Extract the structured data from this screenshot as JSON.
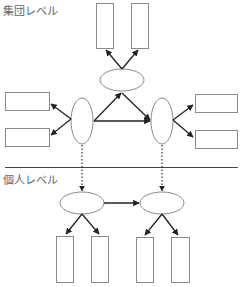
{
  "labels": {
    "group_level": "集団レベル",
    "individual_level": "個人レベル"
  },
  "colors": {
    "shape_stroke": "#8a8a8a",
    "arrow": "#222222",
    "divider": "#444444",
    "label_text": "#666666"
  },
  "diagram": {
    "sections": [
      {
        "name": "group-level",
        "nodes": [
          {
            "id": "top-ellipse",
            "shape": "ellipse",
            "cx": 122,
            "cy": 80,
            "rx": 22,
            "ry": 11
          },
          {
            "id": "left-ellipse",
            "shape": "ellipse",
            "cx": 82,
            "cy": 121,
            "rx": 11,
            "ry": 23
          },
          {
            "id": "right-ellipse",
            "shape": "ellipse",
            "cx": 162,
            "cy": 121,
            "rx": 11,
            "ry": 23
          },
          {
            "id": "top-rect-1",
            "shape": "rect"
          },
          {
            "id": "top-rect-2",
            "shape": "rect"
          },
          {
            "id": "left-rect-1",
            "shape": "rect"
          },
          {
            "id": "left-rect-2",
            "shape": "rect"
          },
          {
            "id": "right-rect-1",
            "shape": "rect"
          },
          {
            "id": "right-rect-2",
            "shape": "rect"
          }
        ],
        "edges": [
          {
            "from": "top-ellipse",
            "to": "top-rect-1",
            "style": "solid"
          },
          {
            "from": "top-ellipse",
            "to": "top-rect-2",
            "style": "solid"
          },
          {
            "from": "left-ellipse",
            "to": "top-ellipse",
            "style": "solid"
          },
          {
            "from": "top-ellipse",
            "to": "right-ellipse",
            "style": "solid"
          },
          {
            "from": "left-ellipse",
            "to": "right-ellipse",
            "style": "solid"
          },
          {
            "from": "left-ellipse",
            "to": "left-rect-1",
            "style": "solid"
          },
          {
            "from": "left-ellipse",
            "to": "left-rect-2",
            "style": "solid"
          },
          {
            "from": "right-ellipse",
            "to": "right-rect-1",
            "style": "solid"
          },
          {
            "from": "right-ellipse",
            "to": "right-rect-2",
            "style": "solid"
          }
        ]
      },
      {
        "name": "individual-level",
        "nodes": [
          {
            "id": "bottom-left-ellipse",
            "shape": "ellipse"
          },
          {
            "id": "bottom-right-ellipse",
            "shape": "ellipse"
          },
          {
            "id": "bottom-rect-1",
            "shape": "rect"
          },
          {
            "id": "bottom-rect-2",
            "shape": "rect"
          },
          {
            "id": "bottom-rect-3",
            "shape": "rect"
          },
          {
            "id": "bottom-rect-4",
            "shape": "rect"
          }
        ],
        "edges": [
          {
            "from": "bottom-left-ellipse",
            "to": "bottom-right-ellipse",
            "style": "solid"
          },
          {
            "from": "bottom-left-ellipse",
            "to": "bottom-rect-1",
            "style": "solid"
          },
          {
            "from": "bottom-left-ellipse",
            "to": "bottom-rect-2",
            "style": "solid"
          },
          {
            "from": "bottom-right-ellipse",
            "to": "bottom-rect-3",
            "style": "solid"
          },
          {
            "from": "bottom-right-ellipse",
            "to": "bottom-rect-4",
            "style": "solid"
          }
        ]
      }
    ],
    "cross_level_edges": [
      {
        "from": "left-ellipse",
        "to": "bottom-left-ellipse",
        "style": "dotted"
      },
      {
        "from": "right-ellipse",
        "to": "bottom-right-ellipse",
        "style": "dotted"
      }
    ]
  }
}
